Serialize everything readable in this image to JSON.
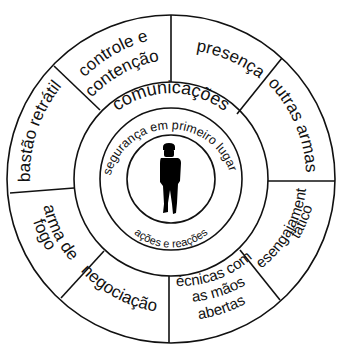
{
  "diagram": {
    "type": "concentric-wheel",
    "center_figure": "person-silhouette-icon",
    "inner_ring": {
      "top_label": "segurança em primeiro lugar",
      "bottom_label": "ações e reações"
    },
    "middle_ring": {
      "label": "comunicações"
    },
    "outer_segments": [
      {
        "id": "presenca",
        "lines": [
          "presença"
        ]
      },
      {
        "id": "outras-armas",
        "lines": [
          "outras armas"
        ]
      },
      {
        "id": "desengajamento-tatico",
        "lines": [
          "desengajamento",
          "tático"
        ]
      },
      {
        "id": "tecnicas-maos-abertas",
        "lines": [
          "técnicas com",
          "as mãos",
          "abertas"
        ]
      },
      {
        "id": "negociacao",
        "lines": [
          "negociação"
        ]
      },
      {
        "id": "arma-de-fogo",
        "lines": [
          "arma de",
          "fogo"
        ]
      },
      {
        "id": "bastao-retratil",
        "lines": [
          "bastão retrátil"
        ]
      },
      {
        "id": "controle-contencao",
        "lines": [
          "controle e",
          "contenção"
        ]
      }
    ],
    "colors": {
      "stroke": "#111111",
      "background": "#ffffff",
      "figure": "#000000"
    }
  }
}
